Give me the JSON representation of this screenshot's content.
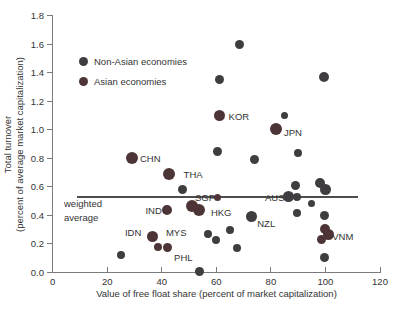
{
  "chart_data": {
    "type": "scatter",
    "title": "",
    "xlabel": "Value of free float share (percent of market capitalization)",
    "ylabel": [
      "Total turnover",
      "(percent of average market capitalization)"
    ],
    "xlim": [
      0,
      120
    ],
    "ylim": [
      0,
      1.8
    ],
    "grid": false,
    "legend_position": "upper-left-inside",
    "x_ticks": [
      "0",
      "20",
      "40",
      "60",
      "80",
      "100",
      "120"
    ],
    "y_ticks": [
      "0.0",
      "0.2",
      "0.4",
      "0.6",
      "0.8",
      "1.0",
      "1.2",
      "1.4",
      "1.6",
      "1.8"
    ],
    "legend": [
      {
        "label": "Non-Asian economies",
        "group": "non_asian"
      },
      {
        "label": "Asian economies",
        "group": "asian"
      }
    ],
    "colors": {
      "non_asian": "#3f3d3f",
      "asian": "#4d3537",
      "axis": "#7a7a7a",
      "text": "#333333",
      "avg_line": "#4d4d4d"
    },
    "weighted_average": {
      "y": 0.527,
      "x_start": 9,
      "x_end": 112,
      "label": [
        "weighted",
        "average"
      ]
    },
    "points": [
      {
        "x": 68.5,
        "y": 1.6,
        "r": 4.5,
        "group": "non_asian"
      },
      {
        "x": 61,
        "y": 1.35,
        "r": 4.5,
        "group": "non_asian"
      },
      {
        "x": 99.5,
        "y": 1.365,
        "r": 5,
        "group": "non_asian"
      },
      {
        "x": 61,
        "y": 1.095,
        "r": 5.5,
        "group": "asian",
        "economy": "KOR"
      },
      {
        "x": 85,
        "y": 1.095,
        "r": 3.5,
        "group": "non_asian"
      },
      {
        "x": 82,
        "y": 1.005,
        "r": 6,
        "group": "asian",
        "economy": "JPN"
      },
      {
        "x": 60.5,
        "y": 0.845,
        "r": 4.5,
        "group": "non_asian"
      },
      {
        "x": 74,
        "y": 0.79,
        "r": 4.5,
        "group": "non_asian"
      },
      {
        "x": 90,
        "y": 0.835,
        "r": 4,
        "group": "non_asian"
      },
      {
        "x": 29,
        "y": 0.8,
        "r": 6,
        "group": "asian",
        "economy": "CHN"
      },
      {
        "x": 42.5,
        "y": 0.69,
        "r": 6,
        "group": "asian",
        "economy": "THA"
      },
      {
        "x": 47.5,
        "y": 0.578,
        "r": 4.5,
        "group": "non_asian"
      },
      {
        "x": 89,
        "y": 0.61,
        "r": 4.5,
        "group": "non_asian"
      },
      {
        "x": 98,
        "y": 0.625,
        "r": 5,
        "group": "non_asian"
      },
      {
        "x": 100,
        "y": 0.578,
        "r": 5.5,
        "group": "non_asian"
      },
      {
        "x": 60.5,
        "y": 0.52,
        "r": 3.5,
        "group": "asian",
        "economy": "SGP"
      },
      {
        "x": 51,
        "y": 0.462,
        "r": 6,
        "group": "asian"
      },
      {
        "x": 53.5,
        "y": 0.437,
        "r": 6,
        "group": "asian",
        "economy": "HKG"
      },
      {
        "x": 42,
        "y": 0.437,
        "r": 5,
        "group": "asian",
        "economy": "IND"
      },
      {
        "x": 86.5,
        "y": 0.532,
        "r": 5.5,
        "group": "non_asian",
        "economy": "AUS"
      },
      {
        "x": 89.5,
        "y": 0.527,
        "r": 4,
        "group": "non_asian"
      },
      {
        "x": 95,
        "y": 0.483,
        "r": 3.5,
        "group": "non_asian"
      },
      {
        "x": 89.5,
        "y": 0.412,
        "r": 4,
        "group": "non_asian"
      },
      {
        "x": 99.5,
        "y": 0.395,
        "r": 4.5,
        "group": "non_asian"
      },
      {
        "x": 73,
        "y": 0.39,
        "r": 5.5,
        "group": "non_asian",
        "economy": "NZL"
      },
      {
        "x": 65,
        "y": 0.295,
        "r": 4,
        "group": "non_asian"
      },
      {
        "x": 57,
        "y": 0.27,
        "r": 4,
        "group": "non_asian"
      },
      {
        "x": 60,
        "y": 0.228,
        "r": 4,
        "group": "non_asian"
      },
      {
        "x": 36.5,
        "y": 0.25,
        "r": 5.5,
        "group": "asian",
        "economy": "IDN"
      },
      {
        "x": 38.5,
        "y": 0.178,
        "r": 4,
        "group": "asian"
      },
      {
        "x": 42,
        "y": 0.17,
        "r": 4.5,
        "group": "asian",
        "economy": "MYS"
      },
      {
        "x": 44,
        "y": 0.105,
        "r": 0,
        "group": "asian",
        "economy": "PHL"
      },
      {
        "x": 100,
        "y": 0.3,
        "r": 5,
        "group": "asian"
      },
      {
        "x": 101,
        "y": 0.265,
        "r": 5.5,
        "group": "asian",
        "economy": "VNM"
      },
      {
        "x": 98.5,
        "y": 0.225,
        "r": 4.5,
        "group": "asian"
      },
      {
        "x": 25,
        "y": 0.12,
        "r": 4,
        "group": "non_asian"
      },
      {
        "x": 67.5,
        "y": 0.17,
        "r": 4,
        "group": "non_asian"
      },
      {
        "x": 54,
        "y": 0.005,
        "r": 4.5,
        "group": "non_asian"
      },
      {
        "x": 99.5,
        "y": 0.1,
        "r": 4.5,
        "group": "non_asian"
      }
    ],
    "point_labels": [
      {
        "text": "KOR",
        "x": 64.5,
        "y": 1.095,
        "anchor": "start"
      },
      {
        "text": "JPN",
        "x": 84.8,
        "y": 0.985,
        "anchor": "start"
      },
      {
        "text": "CHN",
        "x": 32,
        "y": 0.8,
        "anchor": "start"
      },
      {
        "text": "THA",
        "x": 48,
        "y": 0.69,
        "anchor": "start"
      },
      {
        "text": "SGP",
        "x": 59.5,
        "y": 0.525,
        "anchor": "end"
      },
      {
        "text": "HKG",
        "x": 58,
        "y": 0.42,
        "anchor": "start"
      },
      {
        "text": "IND",
        "x": 40,
        "y": 0.437,
        "anchor": "end"
      },
      {
        "text": "AUS",
        "x": 85,
        "y": 0.527,
        "anchor": "end"
      },
      {
        "text": "NZL",
        "x": 75,
        "y": 0.345,
        "anchor": "start"
      },
      {
        "text": "IDN",
        "x": 32.5,
        "y": 0.28,
        "anchor": "end"
      },
      {
        "text": "MYS",
        "x": 41.5,
        "y": 0.28,
        "anchor": "start"
      },
      {
        "text": "PHL",
        "x": 44.5,
        "y": 0.105,
        "anchor": "start"
      },
      {
        "text": "VNM",
        "x": 102.5,
        "y": 0.255,
        "anchor": "start"
      }
    ]
  }
}
